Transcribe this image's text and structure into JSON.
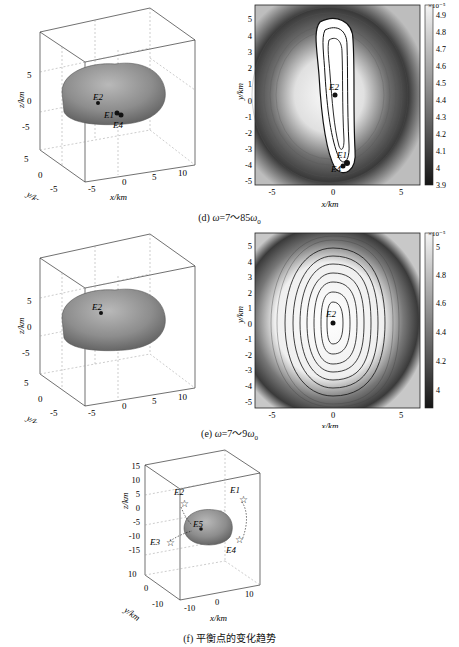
{
  "figure": {
    "panels": [
      {
        "id": "d",
        "caption": "(d) ω=7～85ω₀",
        "caption_parts": {
          "label": "(d) ",
          "omega": "ω",
          "range": "=7～85ω",
          "sub": "0"
        },
        "plot3d": {
          "axes": {
            "z": "z/km",
            "y": "y/km",
            "x": "x/km"
          },
          "z_ticks": [
            "5",
            "0",
            "-5"
          ],
          "y_ticks": [
            "5",
            "0",
            "-5"
          ],
          "x_ticks": [
            "-5",
            "0",
            "5",
            "10"
          ],
          "points": [
            "E2",
            "E1",
            "E4"
          ]
        },
        "contour": {
          "xlabel": "x/km",
          "ylabel": "y/km",
          "x_ticks": [
            "-5",
            "0",
            "5"
          ],
          "y_ticks": [
            "5",
            "4",
            "3",
            "2",
            "1",
            "0",
            "-1",
            "-2",
            "-3",
            "-4",
            "-5"
          ],
          "points": [
            "E2",
            "E1",
            "E4"
          ],
          "colorbar": {
            "exponent": "×10⁻⁵",
            "ticks": [
              "4.9",
              "4.8",
              "4.7",
              "4.6",
              "4.5",
              "4.4",
              "4.3",
              "4.2",
              "4.1",
              "4",
              "3.9"
            ]
          }
        }
      },
      {
        "id": "e",
        "caption": "(e) ω=7～9ω₀",
        "caption_parts": {
          "label": "(e) ",
          "omega": "ω",
          "range": "=7～9ω",
          "sub": "0"
        },
        "plot3d": {
          "axes": {
            "z": "z/km",
            "y": "y/km",
            "x": "x/km"
          },
          "z_ticks": [
            "5",
            "0",
            "-5"
          ],
          "y_ticks": [
            "5",
            "0",
            "-5"
          ],
          "x_ticks": [
            "-5",
            "0",
            "5",
            "10"
          ],
          "points": [
            "E2"
          ]
        },
        "contour": {
          "xlabel": "x/km",
          "ylabel": "y/km",
          "x_ticks": [
            "-5",
            "0",
            "5"
          ],
          "y_ticks": [
            "5",
            "4",
            "3",
            "2",
            "1",
            "0",
            "-1",
            "-2",
            "-3",
            "-4",
            "-5"
          ],
          "points": [
            "E2"
          ],
          "colorbar": {
            "exponent": "×10⁻⁵",
            "ticks": [
              "5",
              "4.8",
              "4.6",
              "4.4",
              "4.2",
              "4"
            ]
          }
        }
      },
      {
        "id": "f",
        "caption": "(f) 平衡点的变化趋势",
        "plot3d": {
          "axes": {
            "z": "z/km",
            "y": "y/km",
            "x": "x/km"
          },
          "z_ticks": [
            "15",
            "10",
            "5",
            "0",
            "-5",
            "-10",
            "-15"
          ],
          "y_ticks": [
            "10",
            "0",
            "-10"
          ],
          "x_ticks": [
            "-10",
            "0",
            "10"
          ],
          "points": [
            "E2",
            "E1",
            "E3",
            "E4",
            "E5"
          ]
        }
      }
    ]
  }
}
